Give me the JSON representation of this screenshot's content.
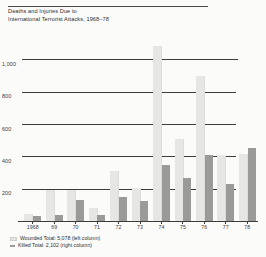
{
  "title": {
    "line1": "Deaths and Injuries Due to",
    "line2": "International Terrorist Attacks,  1968–78"
  },
  "legend": {
    "position": "below-axis",
    "items": [
      {
        "swatch": "light-gray",
        "label": "Wounded Total: 5,078 (left column)"
      },
      {
        "swatch": "dark-gray",
        "label": "Killed Total: 2,102 (right column)"
      }
    ]
  },
  "colors": {
    "wounded": "#e6e6e4",
    "killed": "#9a9a97",
    "axis": "#3c3c3c",
    "text": "#2e2e2e",
    "background": "#fbfbfa"
  },
  "chart_data": {
    "type": "bar",
    "title": "Deaths and Injuries Due to International Terrorist Attacks, 1968–78",
    "xlabel": "",
    "ylabel": "",
    "ylim": [
      0,
      1120
    ],
    "grid": true,
    "yticks": [
      200,
      400,
      600,
      800,
      1000
    ],
    "ytick_labels": [
      "200",
      "400",
      "600",
      "800",
      "1,000"
    ],
    "categories": [
      "1968",
      "69",
      "70",
      "71",
      "72",
      "73",
      "74",
      "75",
      "76",
      "77",
      "78"
    ],
    "series": [
      {
        "name": "Wounded",
        "column": "left",
        "color": "#e6e6e4",
        "values": [
          43,
          190,
          190,
          82,
          310,
          205,
          1080,
          505,
          895,
          410,
          415
        ]
      },
      {
        "name": "Killed",
        "column": "right",
        "color": "#9a9a97",
        "values": [
          34,
          35,
          127,
          36,
          151,
          121,
          345,
          265,
          409,
          230,
          450
        ]
      }
    ],
    "totals": {
      "wounded": 5078,
      "killed": 2102
    }
  }
}
